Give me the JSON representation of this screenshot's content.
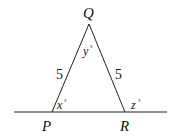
{
  "diagram": {
    "vertices": {
      "P": "P",
      "Q": "Q",
      "R": "R"
    },
    "sides": {
      "PQ": "5",
      "QR": "5"
    },
    "angles": {
      "x": "x",
      "y": "y",
      "z": "z",
      "degree": "°"
    },
    "colors": {
      "line": "#222222",
      "text": "#111111"
    }
  }
}
